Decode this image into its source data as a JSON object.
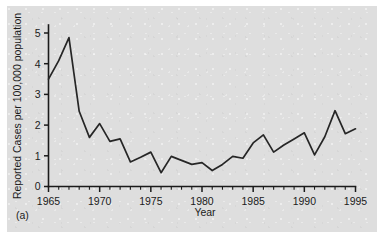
{
  "figure": {
    "panel_label": "(a)",
    "background_color": "#dedede",
    "line_color": "#262626",
    "axis_color": "#1b1b1b"
  },
  "chart_data": {
    "type": "line",
    "title": "",
    "subtitle": "",
    "xlabel": "Year",
    "ylabel": "Reported Cases per 100,000 population",
    "xlim": [
      1965,
      1995
    ],
    "ylim": [
      0,
      5
    ],
    "grid": false,
    "legend": null,
    "legend_position": "none",
    "x_tick_labels": [
      "1965",
      "1970",
      "1975",
      "1980",
      "1985",
      "1990",
      "1995"
    ],
    "x_tick_values": [
      1965,
      1970,
      1975,
      1980,
      1985,
      1990,
      1995
    ],
    "x_minor_tick_interval": 1,
    "y_tick_labels": [
      "0",
      "1",
      "2",
      "3",
      "4",
      "5"
    ],
    "y_tick_values": [
      0,
      1,
      2,
      3,
      4,
      5
    ],
    "x": [
      1965,
      1966,
      1967,
      1968,
      1969,
      1970,
      1971,
      1972,
      1973,
      1974,
      1975,
      1976,
      1977,
      1978,
      1979,
      1980,
      1981,
      1982,
      1983,
      1984,
      1985,
      1986,
      1987,
      1988,
      1989,
      1990,
      1991,
      1992,
      1993,
      1994,
      1995
    ],
    "values": [
      3.5,
      4.1,
      4.85,
      2.45,
      1.6,
      2.05,
      1.47,
      1.55,
      0.8,
      0.95,
      1.12,
      0.45,
      0.98,
      0.85,
      0.72,
      0.78,
      0.52,
      0.72,
      0.98,
      0.92,
      1.42,
      1.68,
      1.12,
      1.35,
      1.55,
      1.75,
      1.03,
      1.62,
      2.47,
      1.72,
      1.88
    ],
    "series": [
      {
        "name": "Reported cases per 100,000 population",
        "values": [
          3.5,
          4.1,
          4.85,
          2.45,
          1.6,
          2.05,
          1.47,
          1.55,
          0.8,
          0.95,
          1.12,
          0.45,
          0.98,
          0.85,
          0.72,
          0.78,
          0.52,
          0.72,
          0.98,
          0.92,
          1.42,
          1.68,
          1.12,
          1.35,
          1.55,
          1.75,
          1.03,
          1.62,
          2.47,
          1.72,
          1.88
        ]
      }
    ],
    "annotations": []
  }
}
